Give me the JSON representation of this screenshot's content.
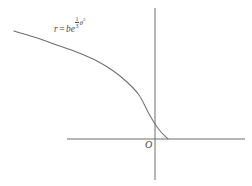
{
  "figure": {
    "background_color": "#ffffff",
    "stroke_color": "#6f6f6f",
    "text_color": "#4a4a4a",
    "width": 252,
    "height": 186
  },
  "equation": {
    "variable": "r",
    "equals": "=",
    "coefficient": "b",
    "exp_base": "e",
    "fraction_numerator": "1",
    "fraction_denominator": "3",
    "exponent_variable": "θ",
    "exponent_power": "2",
    "full_text": "r = be^(1/3 θ^2)"
  },
  "origin": {
    "label": "O"
  },
  "chart_data": {
    "type": "line",
    "title": "",
    "subtitle": "",
    "xlabel": "",
    "ylabel": "",
    "grid": false,
    "legend": false,
    "annotations": [
      {
        "name": "curve-equation",
        "text": "r = be^(1/3 θ^2)",
        "x": 54,
        "y": 19
      },
      {
        "name": "origin-marker",
        "text": "O",
        "x": 145,
        "y": 140
      }
    ],
    "axes": {
      "x_axis": {
        "y": 139,
        "x_start": 67,
        "x_end": 245
      },
      "y_axis": {
        "x": 155,
        "y_start": 8,
        "y_end": 180
      }
    },
    "series": [
      {
        "name": "logarithmic-spiral",
        "points": [
          [
            14,
            31
          ],
          [
            34,
            37
          ],
          [
            54,
            44
          ],
          [
            74,
            51
          ],
          [
            95,
            60
          ],
          [
            112,
            70
          ],
          [
            127,
            82
          ],
          [
            139,
            95
          ],
          [
            148,
            112
          ],
          [
            155,
            124
          ],
          [
            161,
            132
          ],
          [
            168,
            139
          ]
        ]
      }
    ]
  }
}
